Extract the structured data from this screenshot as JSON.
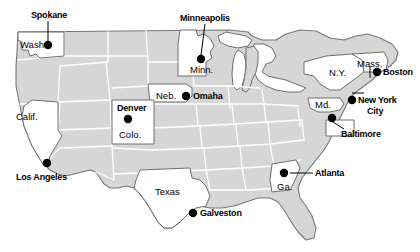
{
  "map": {
    "title": "United States reference map",
    "colors": {
      "land_fill": "#d6d6d6",
      "highlight_fill": "#ffffff",
      "land_stroke": "#777777",
      "state_border": "#ffffff",
      "label_text": "#000000",
      "dot_fill": "#000000",
      "background": "#ffffff"
    },
    "cities": [
      {
        "name": "Spokane",
        "label_x": 31,
        "label_y": 11,
        "dot_x": 48,
        "dot_y": 45,
        "leader": [
          48,
          21,
          48,
          40
        ]
      },
      {
        "name": "Minneapolis",
        "label_x": 180,
        "label_y": 14,
        "dot_x": 201,
        "dot_y": 59,
        "leader": [
          205,
          24,
          201,
          54
        ]
      },
      {
        "name": "Omaha",
        "label_x": 193,
        "label_y": 92,
        "dot_x": 186,
        "dot_y": 96,
        "leader": [
          0,
          0,
          0,
          0
        ]
      },
      {
        "name": "Boston",
        "label_x": 383,
        "label_y": 68,
        "dot_x": 377,
        "dot_y": 72,
        "leader": [
          0,
          0,
          0,
          0
        ]
      },
      {
        "name": "New York",
        "label_x": 358,
        "label_y": 96,
        "dot_x": 352,
        "dot_y": 100,
        "leader": [
          0,
          0,
          0,
          0
        ]
      },
      {
        "name": "City",
        "label_x": 362,
        "label_y": 107,
        "dot_x": 0,
        "dot_y": 0,
        "leader": [
          0,
          0,
          0,
          0
        ]
      },
      {
        "name": "Baltimore",
        "label_x": 341,
        "label_y": 130,
        "dot_x": 332,
        "dot_y": 118,
        "leader": [
          335,
          122,
          344,
          128
        ]
      },
      {
        "name": "Los Angeles",
        "label_x": 16,
        "label_y": 173,
        "dot_x": 47,
        "dot_y": 163,
        "leader": [
          0,
          0,
          0,
          0
        ]
      },
      {
        "name": "Galveston",
        "label_x": 200,
        "label_y": 209,
        "dot_x": 193,
        "dot_y": 213,
        "leader": [
          0,
          0,
          0,
          0
        ]
      },
      {
        "name": "Atlanta",
        "label_x": 315,
        "label_y": 169,
        "dot_x": 284,
        "dot_y": 173,
        "leader": [
          290,
          173,
          312,
          173
        ]
      },
      {
        "name": "Denver",
        "label_x": 117,
        "label_y": 104,
        "dot_x": 128,
        "dot_y": 119,
        "leader": [
          0,
          0,
          0,
          0
        ]
      }
    ],
    "states": [
      {
        "name": "Wash.",
        "label_x": 20,
        "label_y": 40
      },
      {
        "name": "Minn.",
        "label_x": 190,
        "label_y": 65
      },
      {
        "name": "Neb.",
        "label_x": 156,
        "label_y": 91
      },
      {
        "name": "Colo.",
        "label_x": 119,
        "label_y": 130
      },
      {
        "name": "Calif.",
        "label_x": 16,
        "label_y": 112
      },
      {
        "name": "Texas",
        "label_x": 155,
        "label_y": 187
      },
      {
        "name": "Ga.",
        "label_x": 277,
        "label_y": 182
      },
      {
        "name": "Md.",
        "label_x": 315,
        "label_y": 100
      },
      {
        "name": "N.Y.",
        "label_x": 329,
        "label_y": 68
      },
      {
        "name": "Mass.",
        "label_x": 357,
        "label_y": 59
      }
    ]
  }
}
